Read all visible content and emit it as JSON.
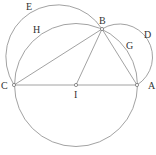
{
  "diagram": {
    "points": {
      "A": {
        "label": "A",
        "x": 137,
        "y": 85,
        "lx": 151,
        "ly": 89
      },
      "B": {
        "label": "B",
        "x": 102,
        "y": 29,
        "lx": 103,
        "ly": 23
      },
      "C": {
        "label": "C",
        "x": 14,
        "y": 85,
        "lx": 4,
        "ly": 89
      },
      "I": {
        "label": "I",
        "x": 76,
        "y": 85,
        "lx": 77,
        "ly": 97
      }
    },
    "arc_labels": {
      "D": {
        "label": "D",
        "x": 148,
        "y": 36
      },
      "E": {
        "label": "E",
        "x": 30,
        "y": 10
      },
      "G": {
        "label": "G",
        "x": 130,
        "y": 48
      },
      "H": {
        "label": "H",
        "x": 37,
        "y": 32
      }
    },
    "circles": [
      {
        "name": "main-circle",
        "cx": 76,
        "cy": 85,
        "r": 61.5
      },
      {
        "name": "arc-E",
        "cx": 57,
        "cy": 55,
        "r": 52
      },
      {
        "name": "arc-D",
        "cx": 121,
        "cy": 55,
        "r": 33
      }
    ],
    "segments": [
      [
        "C",
        "A"
      ],
      [
        "C",
        "B"
      ],
      [
        "B",
        "A"
      ],
      [
        "I",
        "B"
      ]
    ],
    "colors": {
      "stroke": "#8a8a8a",
      "text": "#333333"
    }
  }
}
